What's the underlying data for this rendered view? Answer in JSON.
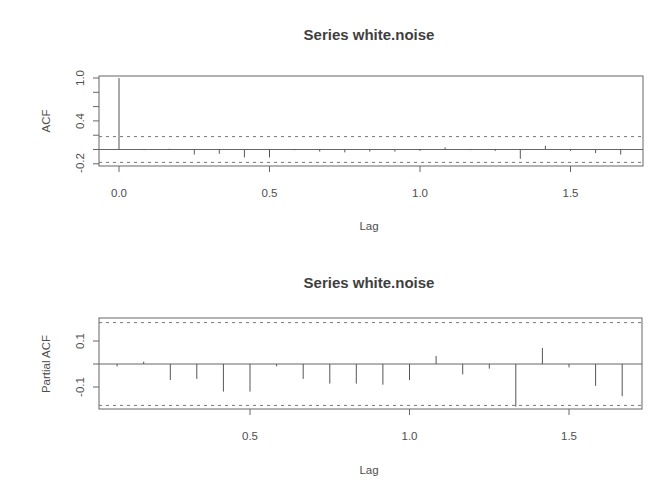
{
  "chart_data": [
    {
      "type": "bar",
      "subtype": "acf-stem",
      "title": "Series  white.noise",
      "xlabel": "Lag",
      "ylabel": "ACF",
      "xticks": [
        "0.0",
        "0.5",
        "1.0",
        "1.5"
      ],
      "xtick_values": [
        0.0,
        0.5,
        1.0,
        1.5
      ],
      "yticks": [
        "-0.2",
        "0.4",
        "1.0"
      ],
      "ytick_values": [
        -0.2,
        0.0,
        0.2,
        0.4,
        0.6,
        0.8,
        1.0
      ],
      "xlim": [
        -0.066,
        1.73
      ],
      "ylim": [
        -0.23,
        1.03
      ],
      "confidence_band": [
        -0.18,
        0.18
      ],
      "confidence_style": "dashed",
      "grid": false,
      "lags": [
        0.0,
        0.0833,
        0.1667,
        0.25,
        0.3333,
        0.4167,
        0.5,
        0.5833,
        0.6667,
        0.75,
        0.8333,
        0.9167,
        1.0,
        1.0833,
        1.1667,
        1.25,
        1.3333,
        1.4167,
        1.5,
        1.5833,
        1.6667
      ],
      "values": [
        1.0,
        -0.01,
        0.01,
        -0.07,
        -0.06,
        -0.11,
        -0.11,
        -0.01,
        -0.03,
        -0.04,
        -0.03,
        -0.03,
        -0.02,
        0.03,
        -0.01,
        -0.02,
        -0.13,
        0.05,
        -0.02,
        -0.05,
        -0.07
      ]
    },
    {
      "type": "bar",
      "subtype": "pacf-stem",
      "title": "Series  white.noise",
      "xlabel": "Lag",
      "ylabel": "Partial ACF",
      "xticks": [
        "0.5",
        "1.0",
        "1.5"
      ],
      "xtick_values": [
        0.5,
        1.0,
        1.5
      ],
      "yticks": [
        "-0.1",
        "0.1"
      ],
      "ytick_values": [
        -0.1,
        0.0,
        0.1
      ],
      "xlim": [
        0.028,
        1.72
      ],
      "ylim": [
        -0.2,
        0.2
      ],
      "confidence_band": [
        -0.18,
        0.18
      ],
      "confidence_style": "dashed",
      "grid": false,
      "lags": [
        0.0833,
        0.1667,
        0.25,
        0.3333,
        0.4167,
        0.5,
        0.5833,
        0.6667,
        0.75,
        0.8333,
        0.9167,
        1.0,
        1.0833,
        1.1667,
        1.25,
        1.3333,
        1.4167,
        1.5,
        1.5833,
        1.6667
      ],
      "values": [
        -0.01,
        0.01,
        -0.07,
        -0.065,
        -0.12,
        -0.12,
        -0.01,
        -0.065,
        -0.085,
        -0.085,
        -0.09,
        -0.07,
        0.035,
        -0.045,
        -0.02,
        -0.185,
        0.07,
        -0.015,
        -0.095,
        -0.14
      ]
    }
  ],
  "plots": {
    "acf": {
      "title": "Series  white.noise",
      "ylabel": "ACF",
      "xlabel": "Lag",
      "ytick_labels": [
        "1.0",
        "0.4",
        "-0.2"
      ],
      "xtick_labels": [
        "0.0",
        "0.5",
        "1.0",
        "1.5"
      ]
    },
    "pacf": {
      "title": "Series  white.noise",
      "ylabel": "Partial ACF",
      "xlabel": "Lag",
      "ytick_labels": [
        "0.1",
        "-0.1"
      ],
      "xtick_labels": [
        "0.5",
        "1.0",
        "1.5"
      ]
    }
  },
  "colors": {
    "line": "#555555",
    "frame": "#666666",
    "text": "#4e4e4e",
    "background": "#ffffff"
  }
}
